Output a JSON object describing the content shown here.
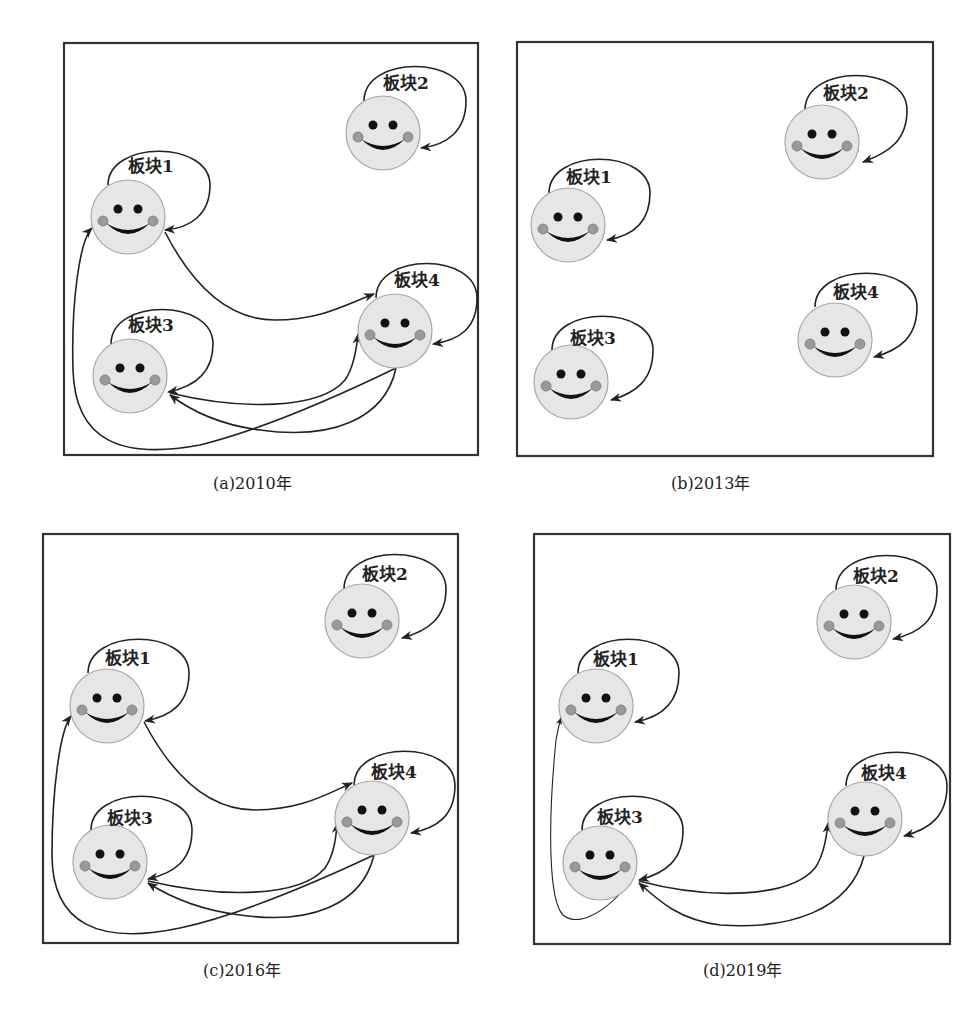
{
  "figure": {
    "node_label_prefix": "板块",
    "colors": {
      "face_fill": "#e6e6e6",
      "face_stroke": "#a8a8a8",
      "cheek": "#9a9a9a",
      "eye": "#111111",
      "edge": "#222222",
      "frame": "#333333"
    },
    "panels": [
      {
        "id": "a",
        "caption": "(a)2010年",
        "frame": {
          "x": 64,
          "y": 43,
          "w": 414,
          "h": 412
        },
        "caption_pos": {
          "x": 255,
          "y": 489
        },
        "nodes": [
          {
            "id": 1,
            "label": "板块1",
            "cx": 128,
            "cy": 217
          },
          {
            "id": 2,
            "label": "板块2",
            "cx": 383,
            "cy": 133
          },
          {
            "id": 3,
            "label": "板块3",
            "cx": 130,
            "cy": 376
          },
          {
            "id": 4,
            "label": "板块4",
            "cx": 395,
            "cy": 331
          }
        ],
        "edges": [
          {
            "from": 1,
            "to": 1
          },
          {
            "from": 2,
            "to": 2
          },
          {
            "from": 3,
            "to": 3
          },
          {
            "from": 4,
            "to": 4
          },
          {
            "from": 1,
            "to": 4
          },
          {
            "from": 3,
            "to": 4
          },
          {
            "from": 4,
            "to": 3
          },
          {
            "from": 4,
            "to": 1
          }
        ]
      },
      {
        "id": "b",
        "caption": "(b)2013年",
        "frame": {
          "x": 517,
          "y": 42,
          "w": 416,
          "h": 414
        },
        "caption_pos": {
          "x": 713,
          "y": 489
        },
        "nodes": [
          {
            "id": 1,
            "label": "板块1",
            "cx": 568,
            "cy": 225
          },
          {
            "id": 2,
            "label": "板块2",
            "cx": 822,
            "cy": 142
          },
          {
            "id": 3,
            "label": "板块3",
            "cx": 571,
            "cy": 382
          },
          {
            "id": 4,
            "label": "板块4",
            "cx": 835,
            "cy": 340
          }
        ],
        "edges": [
          {
            "from": 1,
            "to": 1
          },
          {
            "from": 2,
            "to": 2
          },
          {
            "from": 3,
            "to": 3
          },
          {
            "from": 4,
            "to": 4
          }
        ]
      },
      {
        "id": "c",
        "caption": "(c)2016年",
        "frame": {
          "x": 43,
          "y": 534,
          "w": 415,
          "h": 409
        },
        "caption_pos": {
          "x": 245,
          "y": 976
        },
        "nodes": [
          {
            "id": 1,
            "label": "板块1",
            "cx": 107,
            "cy": 706
          },
          {
            "id": 2,
            "label": "板块2",
            "cx": 362,
            "cy": 621
          },
          {
            "id": 3,
            "label": "板块3",
            "cx": 110,
            "cy": 862
          },
          {
            "id": 4,
            "label": "板块4",
            "cx": 372,
            "cy": 818
          }
        ],
        "edges": [
          {
            "from": 1,
            "to": 1
          },
          {
            "from": 2,
            "to": 2
          },
          {
            "from": 3,
            "to": 3
          },
          {
            "from": 4,
            "to": 4
          },
          {
            "from": 1,
            "to": 4
          },
          {
            "from": 3,
            "to": 4
          },
          {
            "from": 4,
            "to": 3
          },
          {
            "from": 4,
            "to": 1
          }
        ]
      },
      {
        "id": "d",
        "caption": "(d)2019年",
        "frame": {
          "x": 534,
          "y": 534,
          "w": 416,
          "h": 410
        },
        "caption_pos": {
          "x": 745,
          "y": 976
        },
        "nodes": [
          {
            "id": 1,
            "label": "板块1",
            "cx": 596,
            "cy": 706
          },
          {
            "id": 2,
            "label": "板块2",
            "cx": 854,
            "cy": 622
          },
          {
            "id": 3,
            "label": "板块3",
            "cx": 600,
            "cy": 863
          },
          {
            "id": 4,
            "label": "板块4",
            "cx": 865,
            "cy": 819
          }
        ],
        "edges": [
          {
            "from": 1,
            "to": 1
          },
          {
            "from": 2,
            "to": 2
          },
          {
            "from": 3,
            "to": 3
          },
          {
            "from": 4,
            "to": 4
          },
          {
            "from": 3,
            "to": 4
          },
          {
            "from": 4,
            "to": 3
          },
          {
            "from": 3,
            "to": 1
          }
        ]
      }
    ]
  }
}
